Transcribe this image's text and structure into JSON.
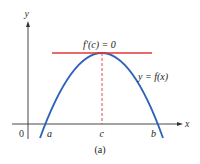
{
  "figure": {
    "caption": "(a)",
    "tangent_label": "f′(c) = 0",
    "curve_label": "y = f(x)",
    "axes": {
      "x_label": "x",
      "y_label": "y",
      "origin_label": "0"
    },
    "points": {
      "a": "a",
      "c": "c",
      "b": "b"
    },
    "colors": {
      "curve": "#2f62b8",
      "tangent": "#e0383a",
      "dashed": "#e0383a",
      "axes": "#333333"
    }
  }
}
